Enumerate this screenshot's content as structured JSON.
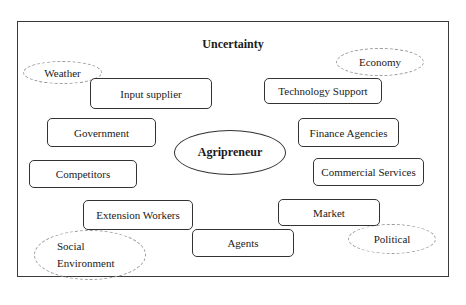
{
  "diagram": {
    "title": "Uncertainty",
    "center": "Agripreneur",
    "actors": [
      {
        "id": "input-supplier",
        "label": "Input supplier"
      },
      {
        "id": "technology-support",
        "label": "Technology Support"
      },
      {
        "id": "government",
        "label": "Government"
      },
      {
        "id": "finance-agencies",
        "label": "Finance Agencies"
      },
      {
        "id": "competitors",
        "label": "Competitors"
      },
      {
        "id": "commercial-services",
        "label": "Commercial Services"
      },
      {
        "id": "extension-workers",
        "label": "Extension Workers"
      },
      {
        "id": "market",
        "label": "Market"
      },
      {
        "id": "agents",
        "label": "Agents"
      }
    ],
    "uncertainties": [
      {
        "id": "weather",
        "label": "Weather"
      },
      {
        "id": "economy",
        "label": "Economy"
      },
      {
        "id": "social-environment",
        "label_line1": "Social",
        "label_line2": "Environment"
      },
      {
        "id": "political",
        "label": "Political"
      }
    ],
    "colors": {
      "border": "#333333",
      "dashed": "#9a9a9a",
      "background": "#ffffff"
    }
  }
}
